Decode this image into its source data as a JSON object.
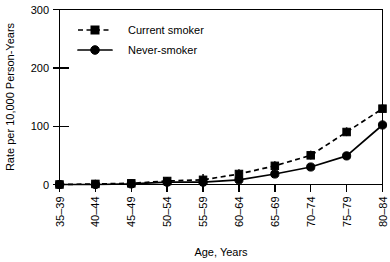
{
  "chart_data": {
    "type": "line",
    "title": "",
    "xlabel": "Age, Years",
    "ylabel": "Rate per 10,000 Person-Years",
    "categories": [
      "35–39",
      "40–44",
      "45–49",
      "50–54",
      "55–59",
      "60–64",
      "65–69",
      "70–74",
      "75–79",
      "80–84"
    ],
    "ylim": [
      0,
      300
    ],
    "yticks": [
      0,
      100,
      200,
      300
    ],
    "ytick_labels": [
      "0",
      "100",
      "200",
      "300"
    ],
    "grid": false,
    "legend_position": "top-left",
    "series": [
      {
        "name": "Current smoker",
        "marker": "square",
        "linestyle": "dashed",
        "color": "#000000",
        "values": [
          0,
          1,
          2,
          6,
          8,
          18,
          32,
          50,
          90,
          130
        ],
        "error_low": [
          0,
          0,
          0,
          1,
          2,
          11,
          25,
          43,
          83,
          123
        ],
        "error_high": [
          0,
          8,
          8,
          13,
          18,
          26,
          40,
          58,
          98,
          138
        ]
      },
      {
        "name": "Never-smoker",
        "marker": "circle",
        "linestyle": "solid",
        "color": "#000000",
        "values": [
          0,
          0,
          1,
          4,
          4,
          8,
          18,
          30,
          49,
          102
        ],
        "error_low": [
          0,
          0,
          0,
          1,
          1,
          4,
          13,
          25,
          43,
          95
        ],
        "error_high": [
          0,
          3,
          4,
          9,
          9,
          13,
          24,
          36,
          56,
          110
        ]
      }
    ],
    "annotations": []
  },
  "legend": {
    "items": [
      {
        "label": "Current smoker",
        "marker": "square",
        "linestyle": "dashed"
      },
      {
        "label": "Never-smoker",
        "marker": "circle",
        "linestyle": "solid"
      }
    ]
  },
  "axes": {
    "y_title": "Rate per 10,000 Person-Years",
    "x_title": "Age, Years",
    "y_tick_0": "0",
    "y_tick_1": "100",
    "y_tick_2": "200",
    "y_tick_3": "300"
  },
  "colors": {
    "ink": "#000000",
    "background": "#ffffff"
  }
}
